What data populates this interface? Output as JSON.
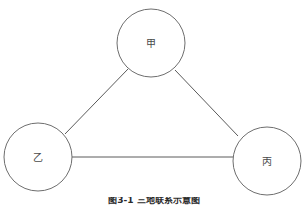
{
  "figure": {
    "background_color": "#ffffff",
    "node_stroke_color": "#6e6e6e",
    "edge_stroke_color": "#5a5a5a",
    "label_color": "#4a4a4a",
    "caption": "图3-1 三地联系示意图",
    "caption_color": "#2b2b2b"
  },
  "diagram": {
    "type": "node-link-triangle",
    "nodes": [
      {
        "id": "jia",
        "label": "甲",
        "cx": 151,
        "cy": 43,
        "r": 34
      },
      {
        "id": "yi",
        "label": "乙",
        "cx": 38,
        "cy": 157,
        "r": 34
      },
      {
        "id": "bing",
        "label": "丙",
        "cx": 267,
        "cy": 161,
        "r": 34
      }
    ],
    "edges": [
      {
        "id": "jia-yi",
        "from": "甲",
        "to": "乙",
        "x1": 128,
        "y1": 69,
        "x2": 65,
        "y2": 134
      },
      {
        "id": "jia-bing",
        "from": "甲",
        "to": "丙",
        "x1": 175,
        "y1": 70,
        "x2": 238,
        "y2": 136
      },
      {
        "id": "yi-bing",
        "from": "乙",
        "to": "丙",
        "x1": 72,
        "y1": 157,
        "x2": 233,
        "y2": 157
      }
    ]
  }
}
